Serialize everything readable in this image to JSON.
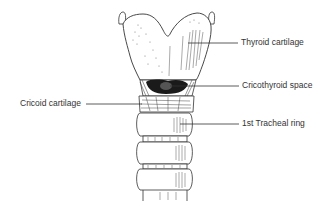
{
  "figure": {
    "labels": [
      {
        "id": "thyroid",
        "text": "Thyroid cartilage"
      },
      {
        "id": "cricothyroid",
        "text": "Cricothyroid space"
      },
      {
        "id": "cricoid",
        "text": "Cricoid cartilage"
      },
      {
        "id": "tracheal_ring",
        "text": "1st Tracheal ring"
      }
    ],
    "colors": {
      "ink": "#333333",
      "background": "#ffffff",
      "shadow": "#1a1a1a"
    }
  }
}
